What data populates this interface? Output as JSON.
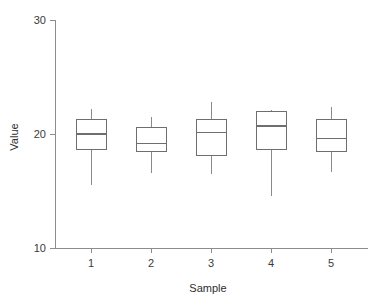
{
  "chart_data": {
    "type": "box",
    "title": "",
    "xlabel": "Sample",
    "ylabel": "Value",
    "categories": [
      "1",
      "2",
      "3",
      "4",
      "5"
    ],
    "ylim": [
      10,
      30
    ],
    "yticks": [
      10,
      20,
      30
    ],
    "ytick_labels": [
      "10",
      "20",
      "30"
    ],
    "xtick_labels": [
      "1",
      "2",
      "3",
      "4",
      "5"
    ],
    "grid": false,
    "legend": null,
    "boxes": [
      {
        "category": "1",
        "whisker_low": 15.5,
        "q1": 18.6,
        "median": 20.0,
        "q3": 21.3,
        "whisker_high": 22.2
      },
      {
        "category": "2",
        "whisker_low": 16.6,
        "q1": 18.5,
        "median": 19.2,
        "q3": 20.6,
        "whisker_high": 21.5
      },
      {
        "category": "3",
        "whisker_low": 16.5,
        "q1": 18.1,
        "median": 20.1,
        "q3": 21.3,
        "whisker_high": 22.8
      },
      {
        "category": "4",
        "whisker_low": 14.6,
        "q1": 18.6,
        "median": 20.7,
        "q3": 22.0,
        "whisker_high": 22.1
      },
      {
        "category": "5",
        "whisker_low": 16.7,
        "q1": 18.5,
        "median": 19.6,
        "q3": 21.3,
        "whisker_high": 22.4
      }
    ],
    "colors": {
      "box_stroke": "#6e6e6e",
      "whisker_stroke": "#8a8a8a",
      "axis": "#8c8c8c",
      "text": "#2e2e2e",
      "background": "#ffffff"
    }
  }
}
